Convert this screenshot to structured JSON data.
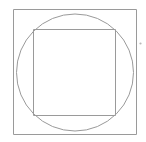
{
  "canvas": {
    "width": 146,
    "height": 142,
    "background_color": "#ffffff"
  },
  "figure": {
    "stroke_color": "#999999",
    "accent_color": "#b0b0b0"
  },
  "shapes": {
    "outer_square": {
      "name": "outer-square",
      "x": 13.5,
      "y": 9.5,
      "width": 123,
      "height": 125,
      "stroke": "#9a9a9a",
      "stroke_width": 1,
      "fill": "none"
    },
    "circle": {
      "name": "inscribed-circle",
      "cx": 75,
      "cy": 72.5,
      "r": 58.5,
      "stroke": "#9a9a9a",
      "stroke_width": 1,
      "fill": "none"
    },
    "inner_square": {
      "name": "inner-square",
      "x": 33.5,
      "y": 29.5,
      "width": 82,
      "height": 86,
      "stroke": "#9a9a9a",
      "stroke_width": 1,
      "fill": "none"
    },
    "mark_dot": {
      "name": "edge-mark-dot",
      "cx": 140.5,
      "cy": 43.5,
      "r": 1.1,
      "fill": "#b8b8b8"
    }
  }
}
